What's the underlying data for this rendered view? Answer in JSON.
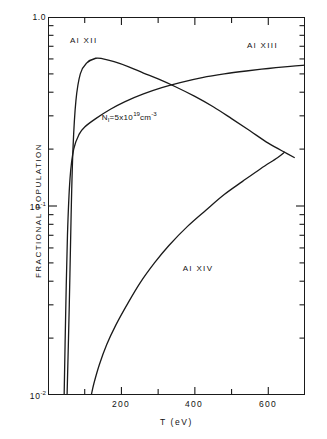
{
  "chart_data": {
    "type": "line",
    "title": "",
    "xlabel": "T  (eV)",
    "ylabel": "FRACTIONAL POPULATION",
    "xscale": "linear",
    "yscale": "log",
    "xlim": [
      0,
      700
    ],
    "ylim": [
      0.01,
      1.0
    ],
    "grid": false,
    "legend": "in-plot curve labels",
    "xticks_major": [
      200,
      400,
      600
    ],
    "xticks_minor": [
      100,
      300,
      500,
      700
    ],
    "xtick_labels": [
      "200",
      "400",
      "600"
    ],
    "ytick_labels": [
      "1.0",
      "10-1",
      "10-2"
    ],
    "ytick_values": [
      1.0,
      0.1,
      0.01
    ],
    "annotations": [
      {
        "name": "density-annotation",
        "text": "NI=5x1019cm-3",
        "base": "N",
        "sub1": "I",
        "mid": "=5x10",
        "exp1": "19",
        "unit": "cm",
        "exp2": "-3",
        "x_eV": 250,
        "y_frac": 0.3
      }
    ],
    "series": [
      {
        "name": "Al XII",
        "label": "Al XII",
        "label_x_eV": 120,
        "label_y_frac": 0.72,
        "points": [
          {
            "T": 52,
            "f": 0.01
          },
          {
            "T": 58,
            "f": 0.03
          },
          {
            "T": 63,
            "f": 0.09
          },
          {
            "T": 68,
            "f": 0.2
          },
          {
            "T": 76,
            "f": 0.36
          },
          {
            "T": 88,
            "f": 0.5
          },
          {
            "T": 105,
            "f": 0.57
          },
          {
            "T": 130,
            "f": 0.605
          },
          {
            "T": 150,
            "f": 0.6
          },
          {
            "T": 180,
            "f": 0.58
          },
          {
            "T": 220,
            "f": 0.545
          },
          {
            "T": 260,
            "f": 0.505
          },
          {
            "T": 300,
            "f": 0.47
          },
          {
            "T": 350,
            "f": 0.425
          },
          {
            "T": 400,
            "f": 0.38
          },
          {
            "T": 450,
            "f": 0.335
          },
          {
            "T": 500,
            "f": 0.29
          },
          {
            "T": 550,
            "f": 0.25
          },
          {
            "T": 600,
            "f": 0.215
          },
          {
            "T": 650,
            "f": 0.19
          },
          {
            "T": 672,
            "f": 0.18
          }
        ]
      },
      {
        "name": "Al XIII",
        "label": "Al XIII",
        "label_x_eV": 580,
        "label_y_frac": 0.66,
        "points": [
          {
            "T": 44,
            "f": 0.01
          },
          {
            "T": 48,
            "f": 0.026
          },
          {
            "T": 53,
            "f": 0.07
          },
          {
            "T": 60,
            "f": 0.14
          },
          {
            "T": 70,
            "f": 0.2
          },
          {
            "T": 85,
            "f": 0.24
          },
          {
            "T": 100,
            "f": 0.262
          },
          {
            "T": 130,
            "f": 0.29
          },
          {
            "T": 170,
            "f": 0.325
          },
          {
            "T": 210,
            "f": 0.357
          },
          {
            "T": 260,
            "f": 0.392
          },
          {
            "T": 310,
            "f": 0.423
          },
          {
            "T": 360,
            "f": 0.45
          },
          {
            "T": 420,
            "f": 0.478
          },
          {
            "T": 480,
            "f": 0.5
          },
          {
            "T": 540,
            "f": 0.518
          },
          {
            "T": 600,
            "f": 0.534
          },
          {
            "T": 660,
            "f": 0.548
          },
          {
            "T": 700,
            "f": 0.556
          }
        ]
      },
      {
        "name": "Al XIV",
        "label": "Al XIV",
        "label_x_eV": 400,
        "label_y_frac": 0.047,
        "points": [
          {
            "T": 118,
            "f": 0.01
          },
          {
            "T": 125,
            "f": 0.0115
          },
          {
            "T": 140,
            "f": 0.0145
          },
          {
            "T": 160,
            "f": 0.0185
          },
          {
            "T": 185,
            "f": 0.0235
          },
          {
            "T": 215,
            "f": 0.03
          },
          {
            "T": 250,
            "f": 0.039
          },
          {
            "T": 290,
            "f": 0.05
          },
          {
            "T": 330,
            "f": 0.062
          },
          {
            "T": 380,
            "f": 0.078
          },
          {
            "T": 430,
            "f": 0.095
          },
          {
            "T": 480,
            "f": 0.115
          },
          {
            "T": 530,
            "f": 0.135
          },
          {
            "T": 580,
            "f": 0.158
          },
          {
            "T": 625,
            "f": 0.18
          },
          {
            "T": 645,
            "f": 0.193
          }
        ]
      }
    ]
  },
  "axes": {
    "y_top_label": "1.0",
    "y_mid_base": "10",
    "y_mid_exp": "-1",
    "y_bot_base": "10",
    "y_bot_exp": "-2",
    "x_title": "T  (eV)",
    "y_title": "FRACTIONAL POPULATION",
    "x_label_200": "200",
    "x_label_400": "400",
    "x_label_600": "600"
  },
  "labels": {
    "al12": "Al XII",
    "al13": "Al XIII",
    "al14": "Al XIV",
    "density_base": "N",
    "density_sub": "I",
    "density_mid": "=5x10",
    "density_exp": "19",
    "density_unit": "cm",
    "density_unit_exp": "-3"
  },
  "colors": {
    "line": "#1a1a1a",
    "background": "#ffffff",
    "text": "#111111"
  }
}
